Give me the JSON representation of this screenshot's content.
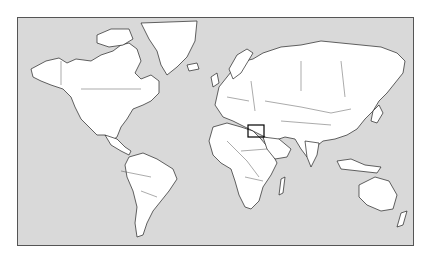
{
  "map": {
    "type": "world-political-outline",
    "projection": "Mercator",
    "colors": {
      "ocean": "#d9d9d9",
      "land": "#ffffff",
      "outline": "#222222",
      "frame": "#555555",
      "highlight": "#000000"
    },
    "highlight": {
      "region": "Eastern Mediterranean / Levant",
      "box_px": {
        "x": 247,
        "y": 124,
        "w": 16,
        "h": 12
      }
    }
  }
}
